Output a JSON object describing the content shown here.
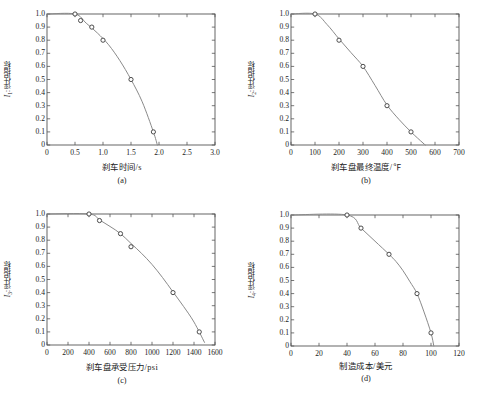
{
  "figure": {
    "axis_color": "#555555",
    "curve_color": "#8a8a8a",
    "marker_edge_color": "#3a3a3a",
    "marker_face_color": "#ffffff"
  },
  "panels": [
    {
      "key": "a",
      "caption": "(a)",
      "ylabel_symbol": "I",
      "ylabel_sub": "1",
      "ylabel_text": ":评估指标",
      "xlabel": "刹车时间/s",
      "xticks": [
        "0",
        "0.5",
        "1.0",
        "1.5",
        "2.0",
        "2.5",
        "3.0"
      ],
      "yticks": [
        "1.0",
        "0.9",
        "0.8",
        "0.7",
        "0.6",
        "0.5",
        "0.4",
        "0.3",
        "0.2",
        "0.1",
        "0"
      ]
    },
    {
      "key": "b",
      "caption": "(b)",
      "ylabel_symbol": "I",
      "ylabel_sub": "2",
      "ylabel_text": ":评估指标",
      "xlabel": "刹车盘最终温度/℉",
      "xticks": [
        "0",
        "100",
        "200",
        "300",
        "400",
        "500",
        "600",
        "700"
      ],
      "yticks": [
        "1.0",
        "0.9",
        "0.8",
        "0.7",
        "0.6",
        "0.5",
        "0.4",
        "0.3",
        "0.2",
        "0.1",
        "0"
      ]
    },
    {
      "key": "c",
      "caption": "(c)",
      "ylabel_symbol": "I",
      "ylabel_sub": "3",
      "ylabel_text": ":评估指标",
      "xlabel": "刹车盘承受压力/psi",
      "xticks": [
        "0",
        "200",
        "400",
        "600",
        "800",
        "1000",
        "1200",
        "1400",
        "1600"
      ],
      "yticks": [
        "1.0",
        "0.9",
        "0.8",
        "0.7",
        "0.6",
        "0.5",
        "0.4",
        "0.3",
        "0.2",
        "0.1",
        "0"
      ]
    },
    {
      "key": "d",
      "caption": "(d)",
      "ylabel_symbol": "I",
      "ylabel_sub": "4",
      "ylabel_text": ":评估指标",
      "xlabel": "制造成本/美元",
      "xticks": [
        "0",
        "20",
        "40",
        "60",
        "80",
        "100",
        "120"
      ],
      "yticks": [
        "1.0",
        "0.9",
        "0.8",
        "0.7",
        "0.6",
        "0.5",
        "0.4",
        "0.3",
        "0.2",
        "0.1",
        "0"
      ]
    }
  ],
  "chart_data": [
    {
      "type": "line",
      "panel": "a",
      "title": "(a)",
      "xlabel": "刹车时间/s",
      "ylabel": "I1:评估指标",
      "xlim": [
        0,
        3.0
      ],
      "ylim": [
        0,
        1.0
      ],
      "xticks": [
        0,
        0.5,
        1.0,
        1.5,
        2.0,
        2.5,
        3.0
      ],
      "yticks": [
        0,
        0.1,
        0.2,
        0.3,
        0.4,
        0.5,
        0.6,
        0.7,
        0.8,
        0.9,
        1.0
      ],
      "grid": false,
      "legend": "none",
      "marker": "open-circle",
      "x": [
        0.5,
        0.6,
        0.8,
        1.0,
        1.5,
        1.9
      ],
      "y": [
        1.0,
        0.95,
        0.9,
        0.8,
        0.5,
        0.1
      ],
      "curve_x": [
        0.0,
        0.5,
        0.7,
        0.9,
        1.1,
        1.3,
        1.5,
        1.7,
        1.9,
        1.97
      ],
      "curve_y": [
        1.0,
        1.0,
        0.93,
        0.855,
        0.765,
        0.645,
        0.5,
        0.33,
        0.1,
        0.0
      ]
    },
    {
      "type": "line",
      "panel": "b",
      "title": "(b)",
      "xlabel": "刹车盘最终温度/℉",
      "ylabel": "I2:评估指标",
      "xlim": [
        0,
        700
      ],
      "ylim": [
        0,
        1.0
      ],
      "xticks": [
        0,
        100,
        200,
        300,
        400,
        500,
        600,
        700
      ],
      "yticks": [
        0,
        0.1,
        0.2,
        0.3,
        0.4,
        0.5,
        0.6,
        0.7,
        0.8,
        0.9,
        1.0
      ],
      "grid": false,
      "legend": "none",
      "marker": "open-circle",
      "x": [
        100,
        200,
        300,
        400,
        500
      ],
      "y": [
        1.0,
        0.8,
        0.6,
        0.3,
        0.1
      ],
      "curve_x": [
        0,
        100,
        150,
        200,
        250,
        300,
        350,
        400,
        450,
        500,
        550,
        560
      ],
      "curve_y": [
        1.0,
        1.0,
        0.92,
        0.81,
        0.705,
        0.6,
        0.455,
        0.305,
        0.195,
        0.1,
        0.015,
        0.0
      ]
    },
    {
      "type": "line",
      "panel": "c",
      "title": "(c)",
      "xlabel": "刹车盘承受压力/psi",
      "ylabel": "I3:评估指标",
      "xlim": [
        0,
        1600
      ],
      "ylim": [
        0,
        1.0
      ],
      "xticks": [
        0,
        200,
        400,
        600,
        800,
        1000,
        1200,
        1400,
        1600
      ],
      "yticks": [
        0,
        0.1,
        0.2,
        0.3,
        0.4,
        0.5,
        0.6,
        0.7,
        0.8,
        0.9,
        1.0
      ],
      "grid": false,
      "legend": "none",
      "marker": "open-circle",
      "x": [
        400,
        500,
        700,
        800,
        1200,
        1450
      ],
      "y": [
        1.0,
        0.95,
        0.85,
        0.75,
        0.4,
        0.1
      ],
      "curve_x": [
        0,
        400,
        500,
        600,
        700,
        800,
        900,
        1000,
        1100,
        1200,
        1300,
        1400,
        1500
      ],
      "curve_y": [
        1.0,
        1.0,
        0.955,
        0.905,
        0.85,
        0.775,
        0.7,
        0.615,
        0.515,
        0.405,
        0.295,
        0.175,
        0.02
      ]
    },
    {
      "type": "line",
      "panel": "d",
      "title": "(d)",
      "xlabel": "制造成本/美元",
      "ylabel": "I4:评估指标",
      "xlim": [
        0,
        120
      ],
      "ylim": [
        0,
        1.0
      ],
      "xticks": [
        0,
        20,
        40,
        60,
        80,
        100,
        120
      ],
      "yticks": [
        0,
        0.1,
        0.2,
        0.3,
        0.4,
        0.5,
        0.6,
        0.7,
        0.8,
        0.9,
        1.0
      ],
      "grid": false,
      "legend": "none",
      "marker": "open-circle",
      "x": [
        40,
        50,
        70,
        90,
        100
      ],
      "y": [
        1.0,
        0.9,
        0.7,
        0.4,
        0.1
      ],
      "curve_x": [
        0,
        40,
        50,
        60,
        70,
        75,
        80,
        85,
        90,
        95,
        100,
        102
      ],
      "curve_y": [
        1.0,
        1.0,
        0.9,
        0.8,
        0.7,
        0.645,
        0.575,
        0.49,
        0.4,
        0.26,
        0.1,
        0.0
      ]
    }
  ]
}
